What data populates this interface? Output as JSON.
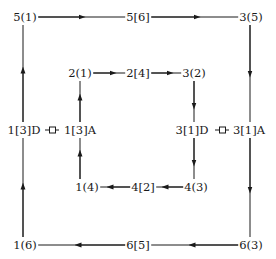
{
  "diagram": {
    "type": "cyclic-flow",
    "line_color": "#1a1a1a",
    "background": "#ffffff",
    "outer_loop": {
      "top_left": "5(1)",
      "top_mid": "5[6]",
      "top_right": "3(5)",
      "left_mid": "1[3]D",
      "right_mid": "3[1]A",
      "bottom_left": "1(6)",
      "bottom_mid": "6[5]",
      "bottom_right": "6(3)"
    },
    "inner_loop": {
      "top_left": "2(1)",
      "top_mid": "2[4]",
      "top_right": "3(2)",
      "left_mid": "1[3]A",
      "right_mid": "3[1]D",
      "bottom_left": "1(4)",
      "bottom_mid": "4[2]",
      "bottom_right": "4(3)"
    },
    "connectors": [
      {
        "from": "1[3]D",
        "to": "1[3]A",
        "symbol": "square-link"
      },
      {
        "from": "3[1]D",
        "to": "3[1]A",
        "symbol": "square-link"
      }
    ],
    "edges": [
      {
        "from": "5(1)",
        "to": "5[6]",
        "direction": "right"
      },
      {
        "from": "5[6]",
        "to": "3(5)",
        "direction": "right"
      },
      {
        "from": "3(5)",
        "to": "3[1]A",
        "direction": "down"
      },
      {
        "from": "3[1]A",
        "to": "6(3)",
        "direction": "down"
      },
      {
        "from": "6(3)",
        "to": "6[5]",
        "direction": "left"
      },
      {
        "from": "6[5]",
        "to": "1(6)",
        "direction": "left"
      },
      {
        "from": "1(6)",
        "to": "1[3]D",
        "direction": "up"
      },
      {
        "from": "1[3]D",
        "to": "5(1)",
        "direction": "up"
      },
      {
        "from": "2(1)",
        "to": "2[4]",
        "direction": "right"
      },
      {
        "from": "2[4]",
        "to": "3(2)",
        "direction": "right"
      },
      {
        "from": "3(2)",
        "to": "3[1]D",
        "direction": "down"
      },
      {
        "from": "3[1]D",
        "to": "4(3)",
        "direction": "down"
      },
      {
        "from": "4(3)",
        "to": "4[2]",
        "direction": "left"
      },
      {
        "from": "4[2]",
        "to": "1(4)",
        "direction": "left"
      },
      {
        "from": "1(4)",
        "to": "1[3]A",
        "direction": "up"
      },
      {
        "from": "1[3]A",
        "to": "2(1)",
        "direction": "up"
      }
    ]
  }
}
